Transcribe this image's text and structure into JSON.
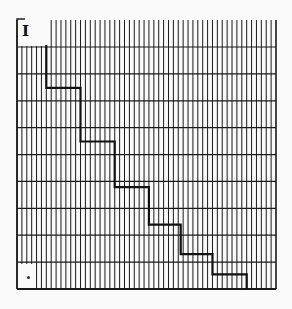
{
  "chart_data": {
    "type": "line",
    "subtype": "step",
    "title": "",
    "panel_label": "I",
    "xlabel": "",
    "ylabel": "",
    "grid": true,
    "grid_vertical_count": 53,
    "grid_horizontal_count": 10,
    "xlim": [
      0,
      53
    ],
    "ylim": [
      0,
      10
    ],
    "series": [
      {
        "name": "step",
        "color": "#111111",
        "x": [
          6,
          6,
          13,
          13,
          20,
          20,
          27,
          27,
          33.5,
          33.5,
          40,
          40,
          47,
          47
        ],
        "y": [
          9.1,
          7.5,
          7.5,
          5.5,
          5.5,
          3.8,
          3.8,
          2.4,
          2.4,
          1.3,
          1.3,
          0.55,
          0.55,
          0
        ]
      }
    ],
    "marker_bottom_left": "•"
  },
  "colors": {
    "grid": "#1a1a1a",
    "background": "#fafafa",
    "line": "#111111"
  }
}
